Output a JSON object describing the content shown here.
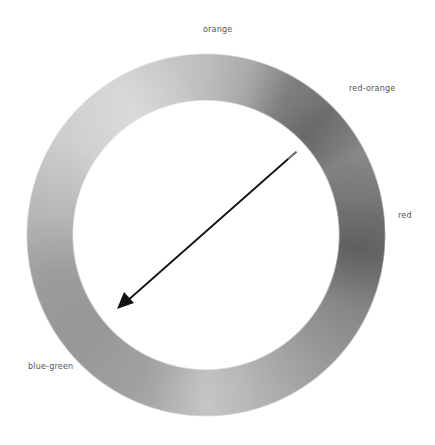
{
  "diagram": {
    "type": "color-wheel-ring",
    "rendering": "grayscale watercolor ring",
    "labels": [
      {
        "id": "orange",
        "text": "orange"
      },
      {
        "id": "red-orange",
        "text": "red-orange"
      },
      {
        "id": "red",
        "text": "red"
      },
      {
        "id": "blue-green",
        "text": "blue-green"
      }
    ],
    "arrow": {
      "from_label": "red-orange",
      "to_label": "blue-green",
      "meaning": "complementary direction across the wheel"
    },
    "colors": {
      "background": "#ffffff",
      "label_text": "#555555",
      "arrow": "#111111",
      "ring_light": "#d3d3d3",
      "ring_medium": "#a5a5a5",
      "ring_dark": "#6a6a6a"
    }
  }
}
